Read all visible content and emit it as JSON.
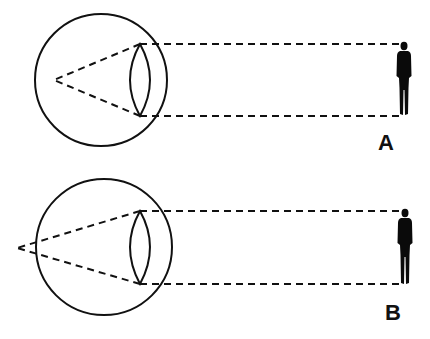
{
  "diagram": {
    "panels": [
      {
        "id": "A",
        "label": "A",
        "description": "Parallel rays focused inside the eye"
      },
      {
        "id": "B",
        "label": "B",
        "description": "Parallel rays focused behind the eye"
      }
    ],
    "colors": {
      "stroke": "#111111",
      "background": "#ffffff",
      "figure": "#0a0a0a"
    }
  }
}
